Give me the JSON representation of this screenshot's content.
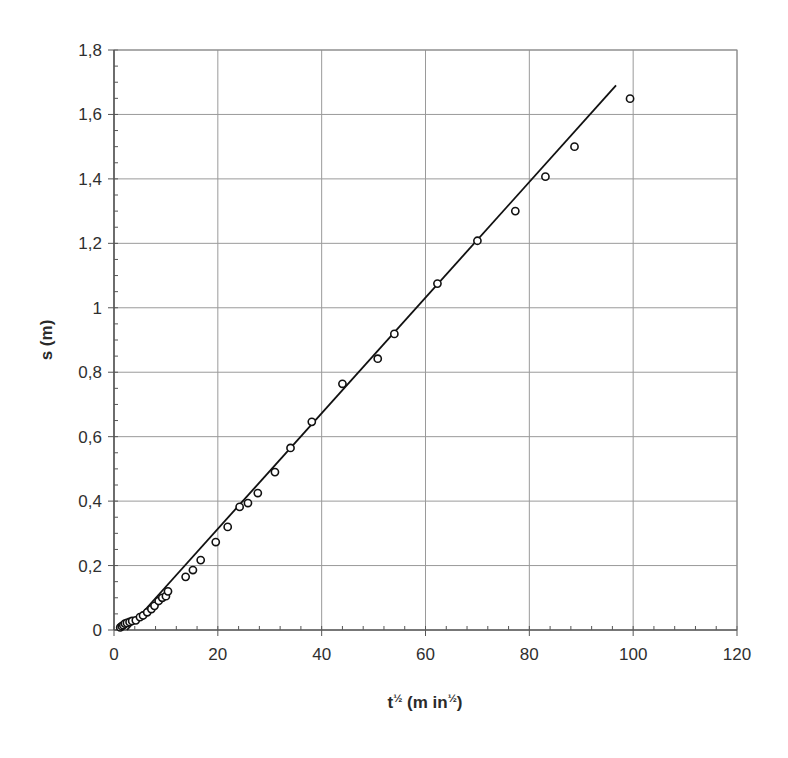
{
  "chart_data": {
    "type": "scatter",
    "title": "",
    "xlabel": "t½  (min½)",
    "ylabel": "s (m)",
    "xlim": [
      0,
      120
    ],
    "ylim": [
      0,
      1.8
    ],
    "x_ticks": [
      0,
      20,
      40,
      60,
      80,
      100,
      120
    ],
    "x_tick_labels": [
      "0",
      "20",
      "40",
      "60",
      "80",
      "100",
      "120"
    ],
    "y_ticks": [
      0,
      0.2,
      0.4,
      0.6,
      0.8,
      1.0,
      1.2,
      1.4,
      1.6,
      1.8
    ],
    "y_tick_labels": [
      "0",
      "0,2",
      "0,4",
      "0,6",
      "0,8",
      "1",
      "1,2",
      "1,4",
      "1,6",
      "1,8"
    ],
    "x_minor_step": 4,
    "y_minor_step": 0.05,
    "grid": true,
    "legend": null,
    "series": [
      {
        "name": "measured",
        "marker": "open-circle",
        "x": [
          1.2,
          1.5,
          1.8,
          2.1,
          2.5,
          3.0,
          3.5,
          4.2,
          5.0,
          5.6,
          6.4,
          7.2,
          7.8,
          8.6,
          9.3,
          10.0,
          10.4,
          13.8,
          15.2,
          16.7,
          19.6,
          21.9,
          24.2,
          25.8,
          27.7,
          31.0,
          34.0,
          38.1,
          44.0,
          50.8,
          54.0,
          62.3,
          70.0,
          77.3,
          83.1,
          88.7,
          99.4
        ],
        "y": [
          0.008,
          0.012,
          0.015,
          0.02,
          0.022,
          0.025,
          0.028,
          0.03,
          0.04,
          0.045,
          0.055,
          0.065,
          0.075,
          0.09,
          0.1,
          0.105,
          0.12,
          0.165,
          0.186,
          0.217,
          0.273,
          0.32,
          0.382,
          0.394,
          0.425,
          0.49,
          0.565,
          0.646,
          0.764,
          0.842,
          0.919,
          1.075,
          1.208,
          1.3,
          1.407,
          1.5,
          1.649
        ]
      },
      {
        "name": "linear fit",
        "marker": "line",
        "x": [
          2.5,
          96.7
        ],
        "y": [
          0.0,
          1.69
        ]
      }
    ]
  },
  "header": {
    "cut_off_text": ""
  }
}
